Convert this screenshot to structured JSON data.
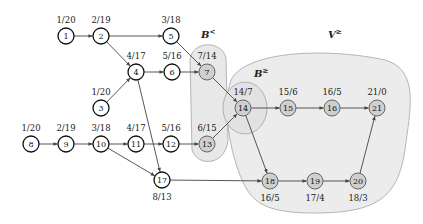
{
  "regions": {
    "b_less": {
      "label": "B",
      "sup": "<"
    },
    "v_geq": {
      "label": "V",
      "sup": "≥"
    },
    "b_geq": {
      "label": "B",
      "sup": "≥"
    }
  },
  "nodes": [
    {
      "id": "1",
      "x": 66,
      "y": 36,
      "label": "1/20",
      "lpos": "above",
      "shaded": false
    },
    {
      "id": "2",
      "x": 101,
      "y": 36,
      "label": "2/19",
      "lpos": "above",
      "shaded": false
    },
    {
      "id": "5",
      "x": 171,
      "y": 36,
      "label": "3/18",
      "lpos": "above",
      "shaded": false
    },
    {
      "id": "4",
      "x": 136,
      "y": 72,
      "label": "4/17",
      "lpos": "above",
      "shaded": false
    },
    {
      "id": "6",
      "x": 172,
      "y": 72,
      "label": "5/16",
      "lpos": "above",
      "shaded": false
    },
    {
      "id": "7",
      "x": 207,
      "y": 72,
      "label": "7/14",
      "lpos": "above",
      "shaded": true
    },
    {
      "id": "3",
      "x": 101,
      "y": 108,
      "label": "1/20",
      "lpos": "above",
      "shaded": false
    },
    {
      "id": "8",
      "x": 31,
      "y": 144,
      "label": "1/20",
      "lpos": "above",
      "shaded": false
    },
    {
      "id": "9",
      "x": 66,
      "y": 144,
      "label": "2/19",
      "lpos": "above",
      "shaded": false
    },
    {
      "id": "10",
      "x": 101,
      "y": 144,
      "label": "3/18",
      "lpos": "above",
      "shaded": false
    },
    {
      "id": "11",
      "x": 136,
      "y": 144,
      "label": "4/17",
      "lpos": "above",
      "shaded": false
    },
    {
      "id": "12",
      "x": 171,
      "y": 144,
      "label": "5/16",
      "lpos": "above",
      "shaded": false
    },
    {
      "id": "13",
      "x": 207,
      "y": 144,
      "label": "6/15",
      "lpos": "above",
      "shaded": true
    },
    {
      "id": "14",
      "x": 243,
      "y": 108,
      "label": "14/7",
      "lpos": "above",
      "shaded": true
    },
    {
      "id": "15",
      "x": 288,
      "y": 108,
      "label": "15/6",
      "lpos": "above",
      "shaded": true
    },
    {
      "id": "16",
      "x": 332,
      "y": 108,
      "label": "16/5",
      "lpos": "above",
      "shaded": true
    },
    {
      "id": "21",
      "x": 377,
      "y": 108,
      "label": "21/0",
      "lpos": "above",
      "shaded": true
    },
    {
      "id": "17",
      "x": 162,
      "y": 180,
      "label": "8/13",
      "lpos": "below",
      "shaded": false
    },
    {
      "id": "18",
      "x": 270,
      "y": 181,
      "label": "16/5",
      "lpos": "below",
      "shaded": true
    },
    {
      "id": "19",
      "x": 315,
      "y": 181,
      "label": "17/4",
      "lpos": "below",
      "shaded": true
    },
    {
      "id": "20",
      "x": 358,
      "y": 181,
      "label": "18/3",
      "lpos": "below",
      "shaded": true
    }
  ],
  "edges": [
    [
      "1",
      "2"
    ],
    [
      "2",
      "5"
    ],
    [
      "2",
      "4"
    ],
    [
      "5",
      "7"
    ],
    [
      "4",
      "6"
    ],
    [
      "6",
      "7"
    ],
    [
      "3",
      "4"
    ],
    [
      "4",
      "17"
    ],
    [
      "8",
      "9"
    ],
    [
      "9",
      "10"
    ],
    [
      "10",
      "11"
    ],
    [
      "11",
      "12"
    ],
    [
      "12",
      "13"
    ],
    [
      "10",
      "17"
    ],
    [
      "7",
      "14"
    ],
    [
      "13",
      "14"
    ],
    [
      "14",
      "15"
    ],
    [
      "15",
      "16"
    ],
    [
      "16",
      "21"
    ],
    [
      "14",
      "18"
    ],
    [
      "17",
      "18"
    ],
    [
      "18",
      "19"
    ],
    [
      "19",
      "20"
    ],
    [
      "20",
      "21"
    ]
  ]
}
